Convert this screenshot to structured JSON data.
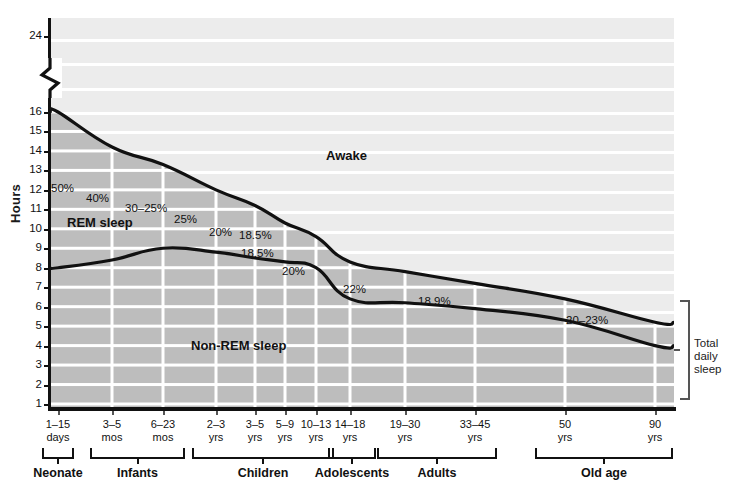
{
  "chart_data": {
    "type": "area",
    "title": "",
    "xlabel": "",
    "ylabel": "Hours",
    "ylim": [
      0,
      16
    ],
    "y_break": {
      "from": 16,
      "to": 24,
      "note": "axis break between 16 and 24"
    },
    "y_ticks": [
      24,
      16,
      15,
      14,
      13,
      12,
      11,
      10,
      9,
      8,
      7,
      6,
      5,
      4,
      3,
      2,
      1
    ],
    "grid": true,
    "legend_position": "in-plot labels",
    "categories": [
      "1-15 days",
      "3-5 mos",
      "6-23 mos",
      "2-3 yrs",
      "3-5 yrs",
      "5-9 yrs",
      "10-13 yrs",
      "14-18 yrs",
      "19-30 yrs",
      "33-45 yrs",
      "50 yrs",
      "90 yrs"
    ],
    "series": [
      {
        "name": "Total daily sleep (top boundary: REM + Non-REM)",
        "units": "hours",
        "values": [
          16.0,
          14.2,
          13.3,
          12.0,
          11.2,
          10.3,
          9.6,
          8.3,
          7.8,
          7.2,
          6.4,
          5.2
        ]
      },
      {
        "name": "Non-REM sleep (bottom boundary)",
        "units": "hours",
        "values": [
          8.0,
          8.4,
          9.0,
          8.8,
          8.5,
          8.3,
          8.0,
          6.4,
          6.2,
          5.9,
          5.3,
          4.0
        ]
      }
    ],
    "rem_percent_annotations": [
      {
        "label": "50%",
        "category": "1-15 days"
      },
      {
        "label": "40%",
        "category": "3-5 mos"
      },
      {
        "label": "30-25%",
        "category": "6-23 mos"
      },
      {
        "label": "25%",
        "category": "2-3 yrs"
      },
      {
        "label": "20%",
        "category": "3-5 yrs"
      },
      {
        "label": "18.5%",
        "category": "5-9 yrs"
      },
      {
        "label": "18.5%",
        "category": "10-13 yrs"
      },
      {
        "label": "20%",
        "category": "14-18 yrs"
      },
      {
        "label": "22%",
        "category": "19-30 yrs"
      },
      {
        "label": "18.9%",
        "category": "33-45 yrs"
      },
      {
        "label": "20-23%",
        "category": "50-90 yrs"
      }
    ],
    "region_labels": [
      "Awake",
      "REM sleep",
      "Non-REM sleep"
    ],
    "colors": {
      "awake_fill": "#ececec",
      "sleep_fill": "#bdbdbd",
      "gridline": "#ffffff",
      "curve": "#111111",
      "axis": "#111111"
    }
  },
  "axis": {
    "y_title": "Hours",
    "y_ticks": [
      "24",
      "16",
      "15",
      "14",
      "13",
      "12",
      "11",
      "10",
      "9",
      "8",
      "7",
      "6",
      "5",
      "4",
      "3",
      "2",
      "1"
    ]
  },
  "x_ticks": [
    {
      "top": "1–15",
      "bottom": "days"
    },
    {
      "top": "3–5",
      "bottom": "mos"
    },
    {
      "top": "6–23",
      "bottom": "mos"
    },
    {
      "top": "2–3",
      "bottom": "yrs"
    },
    {
      "top": "3–5",
      "bottom": "yrs"
    },
    {
      "top": "5–9",
      "bottom": "yrs"
    },
    {
      "top": "10–13",
      "bottom": "yrs"
    },
    {
      "top": "14–18",
      "bottom": "yrs"
    },
    {
      "top": "19–30",
      "bottom": "yrs"
    },
    {
      "top": "33–45",
      "bottom": "yrs"
    },
    {
      "top": "50",
      "bottom": "yrs"
    },
    {
      "top": "90",
      "bottom": "yrs"
    }
  ],
  "groups": [
    {
      "label": "Neonate"
    },
    {
      "label": "Infants"
    },
    {
      "label": "Children"
    },
    {
      "label": "Adolescents"
    },
    {
      "label": "Adults"
    },
    {
      "label": "Old age"
    }
  ],
  "annotations": {
    "awake": "Awake",
    "rem": "REM sleep",
    "nonrem": "Non-REM sleep",
    "p1": "50%",
    "p2": "40%",
    "p3": "30–25%",
    "p4": "25%",
    "p5": "20%",
    "p6": "18.5%",
    "p7": "18.5%",
    "p8": "20%",
    "p9": "22%",
    "p10": "18.9%",
    "p11": "20–23%"
  },
  "total_bracket": {
    "line1": "Total",
    "line2": "daily",
    "line3": "sleep"
  }
}
